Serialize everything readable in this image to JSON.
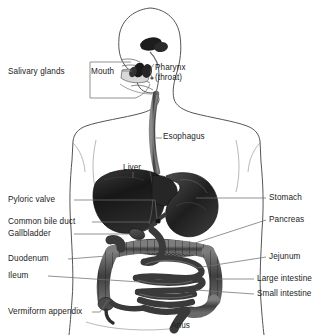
{
  "figure": {
    "style": "grayscale-anatomical-line-drawing",
    "background": "#ffffff",
    "ink": "#1c1c1c",
    "leader_color": "#6f6f6f"
  },
  "labels": {
    "salivary_glands": "Salivary glands",
    "mouth": "Mouth",
    "pharynx_line1": "Pharynx",
    "pharynx_line2": "(throat)",
    "esophagus": "Esophagus",
    "liver": "Liver",
    "pyloric_valve": "Pyloric valve",
    "common_bile_duct": "Common bile duct",
    "gallbladder": "Gallbladder",
    "duodenum": "Duodenum",
    "ileum": "Ileum",
    "vermiform_appendix": "Vermiform appendix",
    "stomach": "Stomach",
    "pancreas": "Pancreas",
    "jejunum": "Jejunum",
    "large_intestine": "Large intestine",
    "small_intestine": "Small intestine",
    "anus": "Anus"
  },
  "label_positions": {
    "salivary_glands": {
      "x": 10,
      "y": 73,
      "side": "left"
    },
    "mouth": {
      "x": 92,
      "y": 73,
      "side": "left"
    },
    "pharynx": {
      "x": 155,
      "y": 68,
      "side": "right"
    },
    "esophagus": {
      "x": 163,
      "y": 136,
      "side": "right"
    },
    "liver": {
      "x": 124,
      "y": 168,
      "side": "right"
    },
    "pyloric_valve": {
      "x": 10,
      "y": 198,
      "side": "left"
    },
    "common_bile_duct": {
      "x": 10,
      "y": 220,
      "side": "left"
    },
    "gallbladder": {
      "x": 10,
      "y": 232,
      "side": "left"
    },
    "duodenum": {
      "x": 10,
      "y": 257,
      "side": "left"
    },
    "ileum": {
      "x": 10,
      "y": 274,
      "side": "left"
    },
    "vermiform_appendix": {
      "x": 10,
      "y": 310,
      "side": "left"
    },
    "stomach": {
      "x": 270,
      "y": 196,
      "side": "right"
    },
    "pancreas": {
      "x": 270,
      "y": 218,
      "side": "right"
    },
    "jejunum": {
      "x": 270,
      "y": 255,
      "side": "right"
    },
    "large_intestine": {
      "x": 258,
      "y": 277,
      "side": "right"
    },
    "small_intestine": {
      "x": 258,
      "y": 292,
      "side": "right"
    },
    "anus": {
      "x": 172,
      "y": 325,
      "side": "center"
    }
  },
  "organs": [
    "salivary-glands",
    "mouth",
    "pharynx",
    "esophagus",
    "liver",
    "stomach",
    "pancreas",
    "gallbladder",
    "common-bile-duct",
    "pyloric-valve",
    "duodenum",
    "jejunum",
    "ileum",
    "small-intestine",
    "large-intestine",
    "vermiform-appendix",
    "anus"
  ]
}
